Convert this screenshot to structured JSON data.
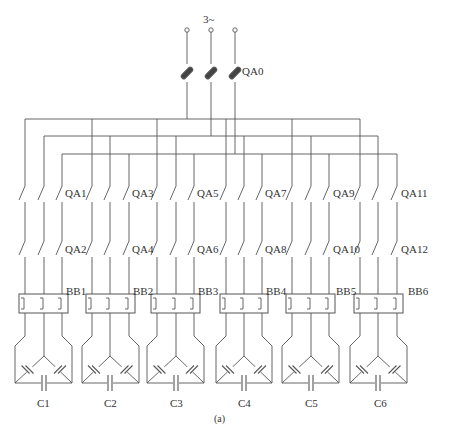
{
  "diagram": {
    "supply_label": "3~",
    "main_breaker": "QA0",
    "caption": "(a)",
    "line_color": "#555555",
    "groups": [
      {
        "x": [
          25,
          44,
          62
        ],
        "upper_switch": "QA1",
        "lower_switch": "QA2",
        "reactor": "BB1",
        "capacitor": "C1"
      },
      {
        "x": [
          92,
          110,
          129
        ],
        "upper_switch": "QA3",
        "lower_switch": "QA4",
        "reactor": "BB2",
        "capacitor": "C2"
      },
      {
        "x": [
          157,
          176,
          194
        ],
        "upper_switch": "QA5",
        "lower_switch": "QA6",
        "reactor": "BB3",
        "capacitor": "C3"
      },
      {
        "x": [
          226,
          244,
          262
        ],
        "upper_switch": "QA7",
        "lower_switch": "QA8",
        "reactor": "BB4",
        "capacitor": "C4"
      },
      {
        "x": [
          292,
          311,
          329
        ],
        "upper_switch": "QA9",
        "lower_switch": "QA10",
        "reactor": "BB5",
        "capacitor": "C5"
      },
      {
        "x": [
          360,
          378,
          397
        ],
        "upper_switch": "QA11",
        "lower_switch": "QA12",
        "reactor": "BB6",
        "capacitor": "C6"
      }
    ]
  }
}
